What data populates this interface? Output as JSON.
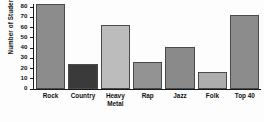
{
  "chart_data": {
    "type": "bar",
    "title": "",
    "xlabel": "",
    "ylabel": "Number of Students",
    "categories": [
      "Rock",
      "Country",
      "Heavy Metal",
      "Rap",
      "Jazz",
      "Folk",
      "Top 40"
    ],
    "values": [
      82,
      24,
      62,
      26,
      41,
      16,
      72
    ],
    "bar_colors": [
      "#8c8c8c",
      "#3a3a3a",
      "#bcbcbc",
      "#939393",
      "#8a8a8a",
      "#adadad",
      "#8c8c8c"
    ],
    "ylim": [
      0,
      80
    ],
    "ytick_step": 10,
    "yticks": [
      0,
      10,
      20,
      30,
      40,
      50,
      60,
      70,
      80
    ],
    "ytick_labels": [
      "0",
      "10",
      "20",
      "30",
      "40",
      "50",
      "60",
      "70",
      "80"
    ],
    "grid": false,
    "legend": null,
    "axis_color": "#1a1a1a",
    "background": "#fdfdfd"
  }
}
